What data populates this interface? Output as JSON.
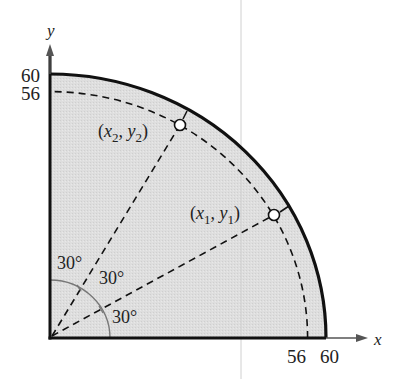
{
  "diagram": {
    "type": "quarter-circle-sector",
    "axes": {
      "x_label": "x",
      "y_label": "y",
      "x_ticks": [
        "56",
        "60"
      ],
      "y_ticks": [
        "60",
        "56"
      ]
    },
    "outer_radius": 60,
    "inner_radius": 56,
    "angles": [
      "30°",
      "30°",
      "30°"
    ],
    "points": [
      {
        "label_open": "(",
        "x": "x",
        "x_sub": "1",
        "sep": ", ",
        "y": "y",
        "y_sub": "1",
        "label_close": ")"
      },
      {
        "label_open": "(",
        "x": "x",
        "x_sub": "2",
        "sep": ", ",
        "y": "y",
        "y_sub": "2",
        "label_close": ")"
      }
    ],
    "colors": {
      "fill": "#dcdcdc",
      "stroke": "#111111",
      "angle_arc": "#777777"
    }
  }
}
